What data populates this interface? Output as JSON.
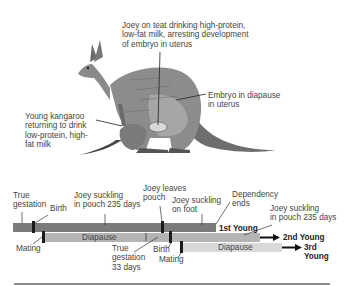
{
  "illustration": {
    "subject": "kangaroo-with-joey-and-young",
    "callouts": [
      {
        "id": "joey-on-teat",
        "lines": [
          "Joey on teat drinking high-protein,",
          "low-fat milk, arresting development",
          "of embryo in uterus"
        ]
      },
      {
        "id": "embryo-diapause",
        "lines": [
          "Embryo in diapause",
          "in uterus"
        ]
      },
      {
        "id": "young-kangaroo",
        "lines": [
          "Young kangaroo",
          "returning to drink",
          "low-protein, high-",
          "fat milk"
        ]
      }
    ]
  },
  "timeline": {
    "colors": {
      "dark_bar": "#7a7a7a",
      "mid_bar": "#b4b4b4",
      "light_bar": "#d9d9d9",
      "marker": "#1a1a1a"
    },
    "rows": [
      {
        "label": "1st Young",
        "bar": "dark"
      },
      {
        "label": "2nd Young",
        "bar": "mid",
        "segment_label": "Diapause"
      },
      {
        "label": "3rd",
        "label2": "Young",
        "bar": "light",
        "segment_label": "Diapause"
      }
    ],
    "annotations": {
      "true_gestation_1": [
        "True",
        "gestation"
      ],
      "birth_1": "Birth",
      "joey_suckling_pouch_1": [
        "Joey suckling",
        "in pouch 235 days"
      ],
      "joey_leaves_pouch": [
        "Joey leaves",
        "pouch"
      ],
      "joey_suckling_foot": [
        "Joey suckling",
        "on foot"
      ],
      "dependency_ends": [
        "Dependency",
        "ends"
      ],
      "joey_suckling_pouch_2": [
        "Joey suckling",
        "in pouch 235 days"
      ],
      "mating_1": "Mating",
      "true_gestation_2": [
        "True",
        "gestation",
        "33 days"
      ],
      "birth_2": "Birth",
      "mating_2": "Mating"
    }
  }
}
